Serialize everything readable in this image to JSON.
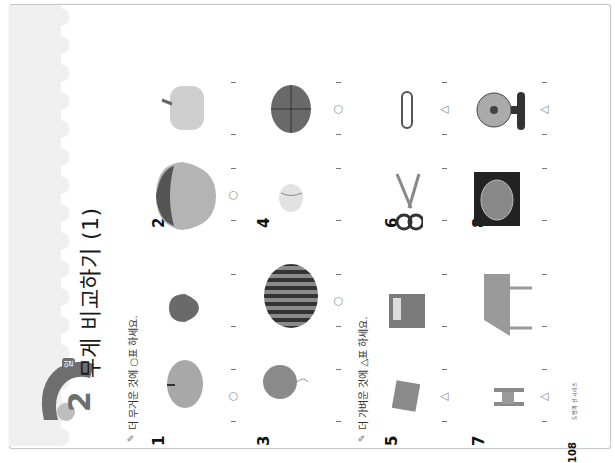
{
  "page": {
    "rotation": "90deg counter-clockwise",
    "day_badge": {
      "number": "2",
      "unit": "일"
    },
    "title": "무게 비교하기 (1)",
    "page_number": "108",
    "book_name": "도형의 신 시리즈",
    "colors": {
      "badge": "#6e6e6e",
      "strip": "#efefef",
      "mark": "#8a8a8a",
      "text": "#1a1a1a"
    }
  },
  "sections": [
    {
      "instruction": "더 무거운 것에 ○표 하세요.",
      "icon": "pencil-icon",
      "mark_symbol": "○",
      "problems": [
        {
          "number": "1",
          "items": [
            {
              "name": "apple",
              "answer": "○"
            },
            {
              "name": "strawberry",
              "answer": ""
            }
          ]
        },
        {
          "number": "2",
          "items": [
            {
              "name": "cabbage",
              "answer": "○"
            },
            {
              "name": "bell-pepper",
              "answer": ""
            }
          ]
        },
        {
          "number": "3",
          "items": [
            {
              "name": "balloon",
              "answer": ""
            },
            {
              "name": "watermelon",
              "answer": "○"
            }
          ]
        },
        {
          "number": "4",
          "items": [
            {
              "name": "tennis-ball",
              "answer": ""
            },
            {
              "name": "basketball",
              "answer": "○"
            }
          ]
        }
      ]
    },
    {
      "instruction": "더 가벼운 것에 △표 하세요.",
      "icon": "pencil-icon",
      "mark_symbol": "△",
      "problems": [
        {
          "number": "5",
          "items": [
            {
              "name": "small-book",
              "answer": "△"
            },
            {
              "name": "big-book",
              "answer": ""
            }
          ]
        },
        {
          "number": "6",
          "items": [
            {
              "name": "scissors",
              "answer": ""
            },
            {
              "name": "paper-clip",
              "answer": "△"
            }
          ]
        },
        {
          "number": "7",
          "items": [
            {
              "name": "toy-chair",
              "answer": "△"
            },
            {
              "name": "table",
              "answer": ""
            }
          ]
        },
        {
          "number": "8",
          "items": [
            {
              "name": "washing-machine",
              "answer": ""
            },
            {
              "name": "desk-fan",
              "answer": "△"
            }
          ]
        }
      ]
    }
  ]
}
